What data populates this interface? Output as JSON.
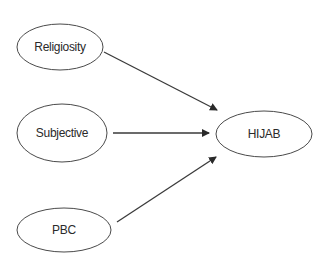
{
  "diagram": {
    "type": "path-model",
    "nodes": [
      {
        "id": "religiosity",
        "label": "Religiosity",
        "cx": 60,
        "cy": 47,
        "rx": 43,
        "ry": 23
      },
      {
        "id": "subjective",
        "label": "Subjective",
        "cx": 62,
        "cy": 133,
        "rx": 45,
        "ry": 29
      },
      {
        "id": "pbc",
        "label": "PBC",
        "cx": 64,
        "cy": 230,
        "rx": 47,
        "ry": 22
      },
      {
        "id": "hijab",
        "label": "HIJAB",
        "cx": 264,
        "cy": 134,
        "rx": 48,
        "ry": 23
      }
    ],
    "edges": [
      {
        "from": "religiosity",
        "to": "hijab",
        "x1": 104,
        "y1": 52,
        "x2": 217,
        "y2": 110
      },
      {
        "from": "subjective",
        "to": "hijab",
        "x1": 113,
        "y1": 133,
        "x2": 209,
        "y2": 133
      },
      {
        "from": "pbc",
        "to": "hijab",
        "x1": 117,
        "y1": 222,
        "x2": 216,
        "y2": 157
      }
    ],
    "colors": {
      "stroke": "#4a4a4a",
      "text": "#2a2a2a",
      "background": "#ffffff"
    }
  }
}
